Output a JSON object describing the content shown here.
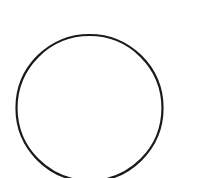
{
  "canvas": {
    "width": 213,
    "height": 178,
    "background": "#ffffff"
  },
  "shapes": [
    {
      "type": "circle",
      "name": "circle-outline",
      "cx": 89.5,
      "cy": 108,
      "r": 73,
      "stroke": "#1a1a1a",
      "stroke_width": 2.2,
      "fill": "none"
    }
  ]
}
